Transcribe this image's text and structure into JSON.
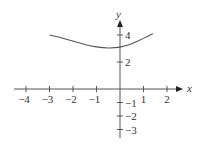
{
  "chart_data": {
    "type": "line",
    "title": "",
    "xlabel": "x",
    "ylabel": "y",
    "xlim": [
      -4.3,
      2.6
    ],
    "ylim": [
      -3.5,
      5.0
    ],
    "grid": false,
    "x_ticks": [
      -4,
      -3,
      -2,
      -1,
      1,
      2
    ],
    "y_ticks": [
      -3,
      -2,
      -1,
      2,
      4
    ],
    "x_tick_labels": [
      "−4",
      "−3",
      "−2",
      "−1",
      "1",
      "2"
    ],
    "y_tick_labels": [
      "−3",
      "−2",
      "−1",
      "2",
      "4"
    ],
    "series": [
      {
        "name": "curve",
        "x": [
          -3,
          -2.5,
          -2,
          -1.5,
          -1,
          -0.5,
          0,
          0.5,
          1,
          1.4
        ],
        "y": [
          4.0,
          3.8,
          3.55,
          3.3,
          3.12,
          3.04,
          3.1,
          3.35,
          3.75,
          4.1
        ]
      }
    ],
    "color": "#555555"
  }
}
